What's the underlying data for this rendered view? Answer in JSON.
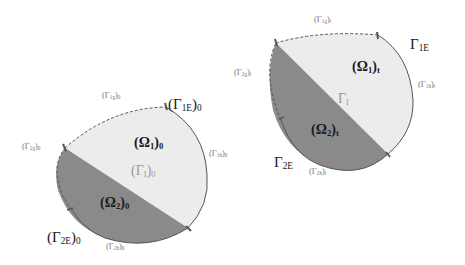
{
  "colors": {
    "omega1_fill": "#ececec",
    "omega2_fill": "#8a8a8a",
    "outline": "#555555",
    "marker": "#555555",
    "background": "#ffffff"
  },
  "left_diagram": {
    "state": "reference (0)",
    "omega1": {
      "sym": "(Ω",
      "sub": "1",
      "post": ")",
      "state": "0"
    },
    "omega2": {
      "sym": "(Ω",
      "sub": "2",
      "post": ")",
      "state": "0"
    },
    "gamma_I": {
      "sym": "(Γ",
      "sub": "I",
      "post": ")",
      "state": "0"
    },
    "gamma_1E": {
      "sym": "(Γ",
      "sub": "1E",
      "post": ")",
      "state": "0"
    },
    "gamma_2E": {
      "sym": "(Γ",
      "sub": "2E",
      "post": ")",
      "state": "0"
    },
    "gamma_1g": {
      "sym": "(Γ",
      "sub": "1g",
      "post": ")",
      "state": "0"
    },
    "gamma_2g": {
      "sym": "(Γ",
      "sub": "2g",
      "post": ")",
      "state": "0"
    },
    "gamma_1h": {
      "sym": "(Γ",
      "sub": "1h",
      "post": ")",
      "state": "0"
    },
    "gamma_2h": {
      "sym": "(Γ",
      "sub": "2h",
      "post": ")",
      "state": "0"
    }
  },
  "right_diagram": {
    "state": "current (t)",
    "omega1": {
      "sym": "(Ω",
      "sub": "1",
      "post": ")",
      "state": "t"
    },
    "omega2": {
      "sym": "(Ω",
      "sub": "2",
      "post": ")",
      "state": "t"
    },
    "gamma_I": {
      "sym": "Γ",
      "sub": "I"
    },
    "gamma_1E": {
      "sym": "Γ",
      "sub": "1E"
    },
    "gamma_2E": {
      "sym": "Γ",
      "sub": "2E"
    },
    "gamma_1g": {
      "sym": "(Γ",
      "sub": "1g",
      "post": ")",
      "state": "t"
    },
    "gamma_2g": {
      "sym": "(Γ",
      "sub": "2g",
      "post": ")",
      "state": "t"
    },
    "gamma_1h": {
      "sym": "(Γ",
      "sub": "1h",
      "post": ")",
      "state": "t"
    },
    "gamma_2h": {
      "sym": "(Γ",
      "sub": "2h",
      "post": ")",
      "state": "t"
    }
  }
}
